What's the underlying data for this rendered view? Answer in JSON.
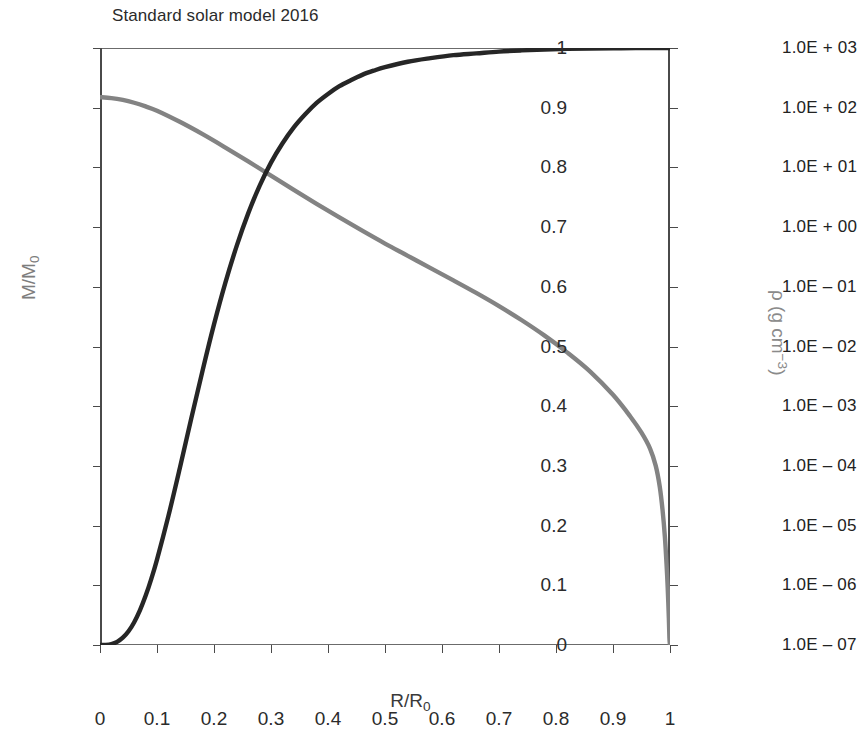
{
  "chart_data": {
    "type": "line",
    "title": "Standard solar model 2016",
    "xlabel": "R/R₀",
    "ylabel_left": "M/M₀",
    "ylabel_right": "ρ (g cm⁻³)",
    "grid": false,
    "legend": "none",
    "xlim": [
      0,
      1
    ],
    "xticks": [
      "0",
      "0.1",
      "0.2",
      "0.3",
      "0.4",
      "0.5",
      "0.6",
      "0.7",
      "0.8",
      "0.9",
      "1"
    ],
    "xtick_values": [
      0,
      0.1,
      0.2,
      0.3,
      0.4,
      0.5,
      0.6,
      0.7,
      0.8,
      0.9,
      1
    ],
    "left_axis": {
      "label": "M/M₀",
      "scale": "linear",
      "ylim": [
        0,
        1
      ],
      "ticks": [
        "0",
        "0.1",
        "0.2",
        "0.3",
        "0.4",
        "0.5",
        "0.6",
        "0.7",
        "0.8",
        "0.9",
        "1"
      ],
      "tick_values": [
        0,
        0.1,
        0.2,
        0.3,
        0.4,
        0.5,
        0.6,
        0.7,
        0.8,
        0.9,
        1
      ],
      "color": "#7d7d7d"
    },
    "right_axis": {
      "label": "ρ (g cm⁻³)",
      "scale": "log",
      "ylim": [
        1e-07,
        1000
      ],
      "ticks": [
        "1.0E + 03",
        "1.0E + 02",
        "1.0E + 01",
        "1.0E + 00",
        "1.0E – 01",
        "1.0E – 02",
        "1.0E – 03",
        "1.0E – 04",
        "1.0E – 05",
        "1.0E – 06",
        "1.0E – 07"
      ],
      "tick_values": [
        1000,
        100,
        10,
        1,
        0.1,
        0.01,
        0.001,
        0.0001,
        1e-05,
        1e-06,
        1e-07
      ],
      "color": "#8a8a8a"
    },
    "series": [
      {
        "name": "M/M₀",
        "axis": "left",
        "color": "#262626",
        "width": 4.4,
        "x": [
          0,
          0.01,
          0.02,
          0.03,
          0.04,
          0.05,
          0.06,
          0.07,
          0.08,
          0.09,
          0.1,
          0.12,
          0.14,
          0.16,
          0.18,
          0.2,
          0.22,
          0.24,
          0.26,
          0.28,
          0.3,
          0.32,
          0.34,
          0.36,
          0.38,
          0.4,
          0.42,
          0.44,
          0.46,
          0.48,
          0.5,
          0.54,
          0.58,
          0.62,
          0.66,
          0.7,
          0.74,
          0.78,
          0.82,
          0.86,
          0.9,
          0.94,
          0.97,
          1.0
        ],
        "y": [
          0,
          0.0002,
          0.0016,
          0.0053,
          0.0122,
          0.023,
          0.0382,
          0.058,
          0.0823,
          0.1108,
          0.143,
          0.216,
          0.296,
          0.379,
          0.46,
          0.537,
          0.607,
          0.669,
          0.723,
          0.769,
          0.808,
          0.84,
          0.867,
          0.889,
          0.908,
          0.923,
          0.936,
          0.946,
          0.955,
          0.962,
          0.968,
          0.977,
          0.983,
          0.988,
          0.991,
          0.994,
          0.996,
          0.9975,
          0.9985,
          0.9991,
          0.9995,
          0.9998,
          0.9999,
          1.0
        ]
      },
      {
        "name": "ρ",
        "axis": "right",
        "color": "#838383",
        "width": 4.4,
        "x": [
          0,
          0.02,
          0.04,
          0.06,
          0.08,
          0.1,
          0.14,
          0.18,
          0.22,
          0.26,
          0.3,
          0.34,
          0.38,
          0.42,
          0.46,
          0.5,
          0.54,
          0.58,
          0.62,
          0.66,
          0.7,
          0.74,
          0.78,
          0.82,
          0.86,
          0.9,
          0.93,
          0.95,
          0.965,
          0.975,
          0.982,
          0.987,
          0.991,
          0.994,
          0.996,
          0.998,
          0.999,
          1.0
        ],
        "y": [
          150,
          145,
          135,
          121,
          105,
          89,
          58,
          36,
          21.5,
          12.6,
          7.3,
          4.2,
          2.45,
          1.45,
          0.87,
          0.53,
          0.33,
          0.205,
          0.128,
          0.079,
          0.0475,
          0.0275,
          0.0152,
          0.0079,
          0.0038,
          0.00155,
          0.00068,
          0.00036,
          0.000195,
          0.0001,
          4.5e-05,
          1.8e-05,
          6.5e-06,
          2.2e-06,
          9e-07,
          2.8e-07,
          1.3e-07,
          1e-07
        ]
      }
    ],
    "annotations": [
      {
        "text": "curves intersect",
        "x": 0.385,
        "y_left": 0.76
      }
    ]
  },
  "figure": {
    "title": "Standard solar model 2016",
    "background": "#ffffff",
    "frame_color": "#4a4a4a",
    "black_curve_color": "#262626",
    "gray_curve_color": "#838383"
  }
}
